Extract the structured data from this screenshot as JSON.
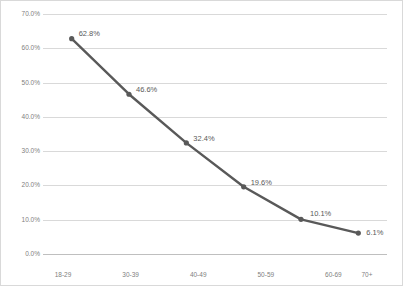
{
  "chart_data": {
    "type": "line",
    "title": "",
    "subtitle": "",
    "xlabel": "",
    "ylabel": "",
    "categories": [
      "18-29",
      "30-39",
      "40-49",
      "50-59",
      "60-69",
      "70+"
    ],
    "values": [
      62.8,
      46.6,
      32.4,
      19.6,
      10.1,
      6.1
    ],
    "data_labels": [
      "62.8%",
      "46.6%",
      "32.4%",
      "19.6%",
      "10.1%",
      "6.1%"
    ],
    "series": [
      {
        "name": "",
        "values": [
          62.8,
          46.6,
          32.4,
          19.6,
          10.1,
          6.1
        ]
      }
    ],
    "ylim": [
      0,
      70
    ],
    "ytick_step": 10,
    "ytick_labels": [
      "0.0%",
      "10.0%",
      "20.0%",
      "30.0%",
      "40.0%",
      "50.0%",
      "60.0%",
      "70.0%"
    ],
    "ytick_values": [
      0,
      10,
      20,
      30,
      40,
      50,
      60,
      70
    ],
    "xtick_labels": [
      "18-29",
      "30-39",
      "40-49",
      "50-59",
      "60-69",
      "70+"
    ],
    "grid": {
      "horizontal": true,
      "vertical": false
    },
    "legend": {
      "visible": false,
      "position": "none"
    },
    "markers": true,
    "colors": {
      "line": "#595959",
      "marker": "#595959",
      "gridline": "#d9d9d9",
      "axis": "#bfbfbf",
      "tick_text": "#808080",
      "label_text": "#595959",
      "plot_background": "#ffffff",
      "border": "#d9d9d9"
    }
  }
}
